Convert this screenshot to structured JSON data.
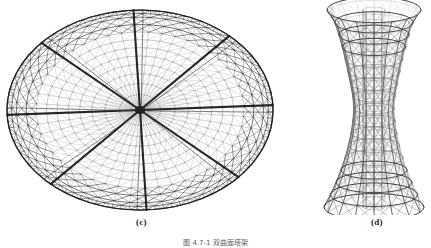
{
  "page": {
    "width": 431,
    "height": 248,
    "background": "#ffffff",
    "type": "figure-plate"
  },
  "colors": {
    "background": "#ffffff",
    "line_dark": "#3a3a3a",
    "line_mid": "#6e6e6e",
    "line_light": "#9a9a9a",
    "line_rib": "#202020",
    "label_text": "#1a1a1a",
    "caption_text": "#2b2b2b"
  },
  "panels": [
    {
      "id": "panel-c",
      "label": "(c)",
      "subject": "schwedler-dome-plan-perspective",
      "title": "",
      "geometry": {
        "center_x": 140,
        "center_y": 110,
        "outer_rx": 133,
        "outer_ry": 100,
        "inner_ring_rx": 92,
        "inner_ring_ry": 69,
        "radial_ribs": 8,
        "meridian_lines": 48,
        "hoop_rings": 11,
        "outer_band_rings": 3,
        "bracing": "diagonal-k-bracing"
      }
    },
    {
      "id": "panel-d",
      "label": "(d)",
      "subject": "hyperboloid-lattice-tower-elevation",
      "title": "",
      "geometry": {
        "center_x": 56,
        "top_y": 10,
        "bottom_y": 207,
        "top_radius_x": 47,
        "waist_radius_x": 20,
        "bottom_radius_x": 50,
        "waist_y_fraction": 0.47,
        "ring_count": 17,
        "vertical_columns": 16,
        "ring_ellipse_ratio": 0.27,
        "bracing": "x-bracing"
      }
    }
  ],
  "labels": {
    "panel_c": "(c)",
    "panel_d": "(d)"
  },
  "caption": {
    "text": "图 4.7-1  双曲面塔架",
    "visible": "partially clipped at bottom edge"
  }
}
